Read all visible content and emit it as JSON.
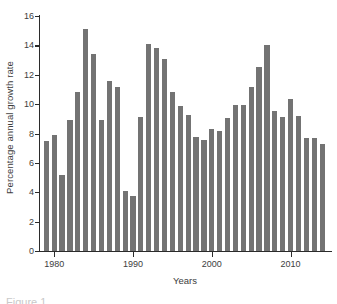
{
  "chart_data": {
    "type": "bar",
    "title": "",
    "xlabel": "Years",
    "ylabel": "Percentage annual growth rate",
    "xlim": [
      1978.2,
      2015.0
    ],
    "ylim": [
      0,
      16
    ],
    "ytick_values": [
      0,
      2,
      4,
      6,
      8,
      10,
      12,
      14,
      16
    ],
    "ytick_labels": [
      "0",
      "2",
      "4",
      "6",
      "8",
      "10",
      "12",
      "14",
      "16"
    ],
    "xtick_values": [
      1980,
      1990,
      2000,
      2010
    ],
    "xtick_labels": [
      "1980",
      "1990",
      "2000",
      "2010"
    ],
    "grid": false,
    "legend": null,
    "bar_color": "#737373",
    "axis_color": "#2b2b2b",
    "background_color": "#ffffff",
    "categories": [
      1979,
      1980,
      1981,
      1982,
      1983,
      1984,
      1985,
      1986,
      1987,
      1988,
      1989,
      1990,
      1991,
      1992,
      1993,
      1994,
      1995,
      1996,
      1997,
      1998,
      1999,
      2000,
      2001,
      2002,
      2003,
      2004,
      2005,
      2006,
      2007,
      2008,
      2009,
      2010,
      2011,
      2012,
      2013,
      2014
    ],
    "values": [
      7.5,
      7.9,
      5.2,
      8.95,
      10.85,
      15.1,
      13.4,
      8.9,
      11.55,
      11.2,
      4.1,
      3.75,
      9.15,
      14.1,
      13.8,
      13.05,
      10.8,
      9.9,
      9.25,
      7.75,
      7.55,
      8.3,
      8.2,
      9.05,
      9.95,
      9.95,
      11.15,
      12.55,
      14.05,
      9.5,
      9.1,
      10.35,
      9.2,
      7.7,
      7.7,
      7.3
    ]
  },
  "axis": {
    "y_title": "Percentage annual growth rate",
    "x_title": "Years"
  },
  "caption": {
    "text": "Figure 1."
  }
}
